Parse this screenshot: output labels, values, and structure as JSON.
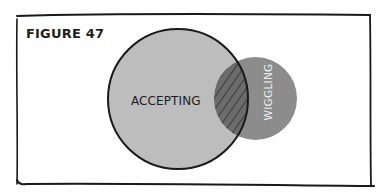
{
  "figure": {
    "title": "FIGURE 47",
    "frame_color": "#1a1a1a",
    "background_color": "#ffffff"
  },
  "venn": {
    "sets": [
      {
        "label": "ACCEPTING",
        "fill_color": "#bdbdbd",
        "outline_color": "#1a1a1a",
        "text_color": "#1e1e1e"
      },
      {
        "label": "WIGGLING",
        "fill_color": "#8c8c8c",
        "text_color": "#eeeeee",
        "label_orientation": "vertical"
      }
    ],
    "overlap": {
      "fill_color": "#6c6c6c",
      "hatch_color": "#3f3f3f",
      "pattern": "diagonal-hatch"
    }
  }
}
